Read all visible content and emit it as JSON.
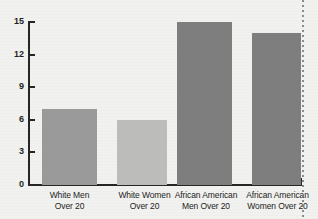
{
  "chart_data": {
    "type": "bar",
    "title": "",
    "xlabel": "",
    "ylabel": "",
    "ylim": [
      0,
      15
    ],
    "yticks": [
      "0",
      "3",
      "6",
      "9",
      "12",
      "15"
    ],
    "grid": false,
    "legend": null,
    "categories": [
      "White Men Over 20",
      "White Women Over 20",
      "African American Men Over 20",
      "African American Women Over 20"
    ],
    "category_lines": [
      [
        "White Men",
        "Over 20"
      ],
      [
        "White Women",
        "Over 20"
      ],
      [
        "African American",
        "Men Over 20"
      ],
      [
        "African American",
        "Women Over 20"
      ]
    ],
    "values": [
      7,
      6,
      15,
      14
    ],
    "bar_colors": [
      "#9a9a9a",
      "#bcbcbb",
      "#7e7e7e",
      "#7e7e7e"
    ]
  },
  "colors": {
    "background": "#f1f1ef",
    "axis": "#262626",
    "text": "#1d1d1d",
    "page_edge": "#7a7a78"
  }
}
